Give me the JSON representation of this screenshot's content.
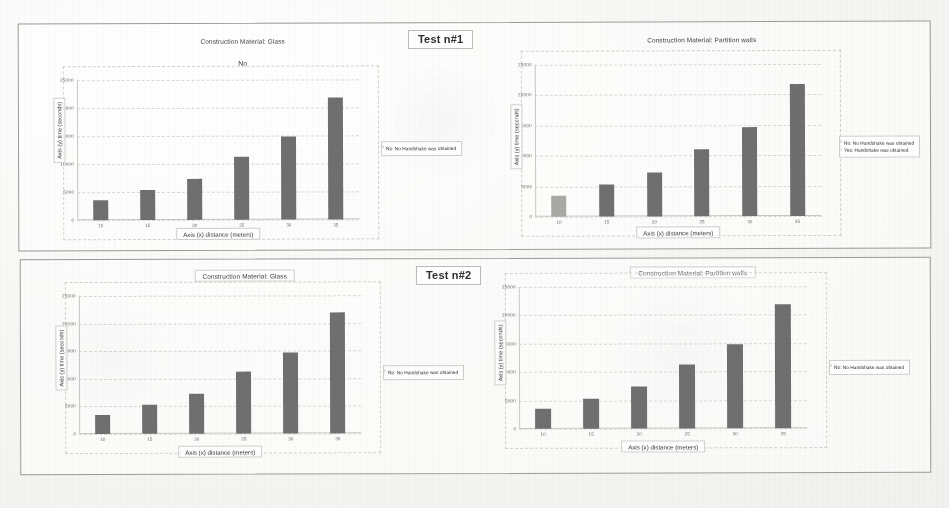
{
  "document": {
    "kind": "scanned-figure-sheet",
    "panels": [
      {
        "tag": "Test n#1"
      },
      {
        "tag": "Test n#2"
      }
    ]
  },
  "legend_labels": {
    "no": "No: No Handshake was obtained",
    "yes": "Yes: Handshake was obtained",
    "key_no": "No",
    "key_yes": "Yes"
  },
  "colors": {
    "bar_no": "#6f6f6f",
    "bar_yes": "#a9a9a6",
    "grid": "#d8d8d2",
    "axis": "#c9c9c3",
    "text": "#3a3a3a",
    "tick_text": "#6c6c6a",
    "panel_border": "#9b9b97",
    "paper": "#f7f7f5"
  },
  "chart_data": [
    {
      "id": "test1-glass",
      "type": "bar",
      "title": "Construction Material: Glass",
      "subtitle": "No",
      "xlabel": "Axis (x) distance (meters)",
      "ylabel": "Axis (y) time (seconds)",
      "categories": [
        "10",
        "15",
        "20",
        "25",
        "30",
        "35"
      ],
      "yticks": [
        "0",
        "5000",
        "10000",
        "15000",
        "20000",
        "25000"
      ],
      "ylim": [
        0,
        25000
      ],
      "grid": true,
      "legend_position": "right",
      "series": [
        {
          "name": "No: No Handshake was obtained",
          "color": "#6f6f6f",
          "values": [
            3600,
            5400,
            7400,
            11300,
            14900,
            21800
          ]
        }
      ]
    },
    {
      "id": "test1-partition",
      "type": "bar",
      "title": "Construction Material: Partition walls",
      "subtitle": "",
      "xlabel": "Axis (x) distance (meters)",
      "ylabel": "Axis (y) time (seconds)",
      "categories": [
        "10",
        "15",
        "20",
        "25",
        "30",
        "35"
      ],
      "yticks": [
        "0",
        "5000",
        "10000",
        "15000",
        "20000",
        "25000"
      ],
      "ylim": [
        0,
        25000
      ],
      "grid": true,
      "legend_position": "right",
      "series": [
        {
          "name": "No: No Handshake was obtained",
          "color": "#6f6f6f",
          "values": [
            null,
            5300,
            7300,
            11000,
            14700,
            21700
          ]
        },
        {
          "name": "Yes: Handshake was obtained",
          "color": "#a9a9a6",
          "values": [
            3500,
            null,
            null,
            null,
            null,
            null
          ]
        }
      ]
    },
    {
      "id": "test2-glass",
      "type": "bar",
      "title": "Construction Material: Glass",
      "subtitle": "",
      "xlabel": "Axis (x) distance (meters)",
      "ylabel": "Axis (y) time (seconds)",
      "categories": [
        "10",
        "15",
        "20",
        "25",
        "30",
        "35"
      ],
      "yticks": [
        "0",
        "5000",
        "10000",
        "15000",
        "20000",
        "25000"
      ],
      "ylim": [
        0,
        25000
      ],
      "grid": true,
      "legend_position": "right",
      "series": [
        {
          "name": "No: No Handshake was obtained",
          "color": "#6f6f6f",
          "values": [
            3500,
            5300,
            7300,
            11200,
            14700,
            21900
          ]
        }
      ]
    },
    {
      "id": "test2-partition",
      "type": "bar",
      "title": "Construction Material: Partition walls",
      "subtitle": "",
      "xlabel": "Axis (x) distance (meters)",
      "ylabel": "Axis (y) time (seconds)",
      "categories": [
        "10",
        "15",
        "20",
        "25",
        "30",
        "35"
      ],
      "yticks": [
        "0",
        "5000",
        "10000",
        "15000",
        "20000",
        "25000"
      ],
      "ylim": [
        0,
        25000
      ],
      "grid": true,
      "legend_position": "right",
      "series": [
        {
          "name": "No: No Handshake was obtained",
          "color": "#6f6f6f",
          "values": [
            3500,
            5300,
            7400,
            11200,
            14800,
            21900
          ]
        }
      ]
    }
  ]
}
